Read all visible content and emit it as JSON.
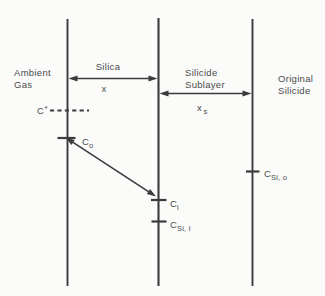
{
  "diagram": {
    "colors": {
      "background": "#fbfbfa",
      "line": "#3b3b3b",
      "text": "#4a4a4a"
    },
    "regions": {
      "ambient_gas": {
        "line1": "Ambient",
        "line2": "Gas"
      },
      "silica": {
        "label": "Silica",
        "thickness_label": "x"
      },
      "silicide_sublayer": {
        "line1": "Silicide",
        "line2": "Sublayer",
        "thickness_label_main": "x",
        "thickness_label_sub": "s"
      },
      "original_silicide": {
        "line1": "Original",
        "line2": "Silicide"
      }
    },
    "concentrations": {
      "c_star": {
        "main": "C",
        "sup": "*"
      },
      "c_o": {
        "main": "C",
        "sub": "o"
      },
      "c_i": {
        "main": "C",
        "sub": "i"
      },
      "c_si_i": {
        "main": "C",
        "sub": "Si, i"
      },
      "c_si_o": {
        "main": "C",
        "sub": "Si, o"
      }
    }
  }
}
